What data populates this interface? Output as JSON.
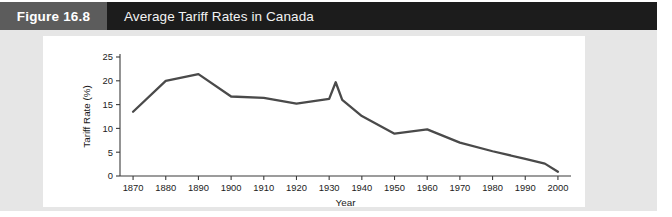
{
  "figure": {
    "number_label": "Figure 16.8",
    "title": "Average Tariff Rates in Canada"
  },
  "colors": {
    "figure_number_block": "#5c5c5c",
    "title_block": "#1c1c1c",
    "panel_background": "#e6e6e6",
    "chart_background": "#ffffff",
    "line_color": "#4a4a4a",
    "axis_color": "#3b3b3b"
  },
  "chart_data": {
    "type": "line",
    "title": "Average Tariff Rates in Canada",
    "xlabel": "Year",
    "ylabel": "Tariff Rate (%)",
    "xlim": [
      1866,
      2004
    ],
    "ylim": [
      0,
      25
    ],
    "grid": false,
    "legend": null,
    "x_ticks": [
      1870,
      1880,
      1890,
      1900,
      1910,
      1920,
      1930,
      1940,
      1950,
      1960,
      1970,
      1980,
      1990,
      2000
    ],
    "x_tick_labels": [
      "1870",
      "1880",
      "1890",
      "1900",
      "1910",
      "1920",
      "1930",
      "1940",
      "1950",
      "1960",
      "1970",
      "1980",
      "1990",
      "2000"
    ],
    "y_ticks": [
      0,
      5,
      10,
      15,
      20,
      25
    ],
    "y_tick_labels": [
      "0",
      "5",
      "10",
      "15",
      "20",
      "25"
    ],
    "series": [
      {
        "name": "Average tariff rate",
        "x": [
          1870,
          1880,
          1890,
          1900,
          1910,
          1920,
          1930,
          1932,
          1934,
          1940,
          1950,
          1960,
          1970,
          1980,
          1990,
          1996,
          2000
        ],
        "values": [
          13.5,
          20.0,
          21.4,
          16.7,
          16.4,
          15.2,
          16.2,
          19.7,
          16.0,
          12.6,
          8.9,
          9.8,
          7.0,
          5.2,
          3.6,
          2.6,
          0.9
        ]
      }
    ]
  }
}
